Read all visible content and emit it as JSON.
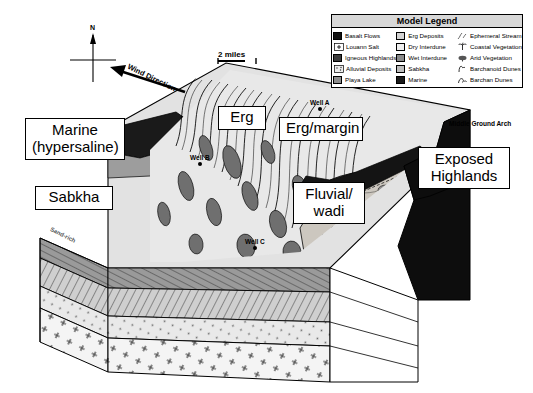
{
  "figure": {
    "type": "geologic-block-diagram",
    "compass_north": "N",
    "wind_direction_label": "Wind Direction",
    "scale_bar": "2 miles",
    "cross_section_label": "Sand-rich"
  },
  "callouts": [
    {
      "id": "marine",
      "line1": "Marine",
      "line2": "(hypersaline)"
    },
    {
      "id": "sabkha",
      "line1": "Sabkha",
      "line2": ""
    },
    {
      "id": "erg",
      "line1": "Erg",
      "line2": ""
    },
    {
      "id": "erg-margin",
      "line1": "Erg/margin",
      "line2": ""
    },
    {
      "id": "fluvial",
      "line1": "Fluvial/",
      "line2": "wadi"
    },
    {
      "id": "exposed",
      "line1": "Exposed",
      "line2": "Highlands"
    }
  ],
  "annotations": {
    "middle_ground_arch": "Middle Ground Arch"
  },
  "wells": [
    {
      "name": "Well A"
    },
    {
      "name": "Well B"
    },
    {
      "name": "Well C"
    }
  ],
  "legend": {
    "title": "Model Legend",
    "column1": [
      {
        "label": "Basalt Flows",
        "color": "#111111"
      },
      {
        "label": "Louann Salt",
        "color": "#ffffff"
      },
      {
        "label": "Igneous Highlands",
        "color": "#3a3a3a"
      },
      {
        "label": "Alluvial Deposits",
        "color": "#ffffff"
      },
      {
        "label": "Playa Lake",
        "color": "#8c8c8c"
      }
    ],
    "column2": [
      {
        "label": "Erg Deposits",
        "color": "#d3d3d3"
      },
      {
        "label": "Dry Interdune",
        "color": "#efefef"
      },
      {
        "label": "Wet Interdune",
        "color": "#8a8a8a"
      },
      {
        "label": "Sabkha",
        "color": "#bdbdbd"
      },
      {
        "label": "Marine",
        "color": "#1a1a1a"
      }
    ],
    "column3": [
      {
        "label": "Ephemeral Stream",
        "symbol": "stream-symbol"
      },
      {
        "label": "Coastal Vegetation",
        "symbol": "palm-symbol"
      },
      {
        "label": "Arid Vegetation",
        "symbol": "shrub-symbol"
      },
      {
        "label": "Barchanoid Dunes",
        "symbol": "barchanoid-dune-symbol"
      },
      {
        "label": "Barchan Dunes",
        "symbol": "barchan-dune-symbol"
      }
    ]
  },
  "colors": {
    "marine_dark": "#111111",
    "erg_light": "#dcdcdc",
    "interdune_dark": "#707070",
    "highlands_dark": "#0d0d0d",
    "sabkha_grey": "#b9b9b9",
    "basement_light": "#f2f2f2",
    "outline": "#000000"
  }
}
